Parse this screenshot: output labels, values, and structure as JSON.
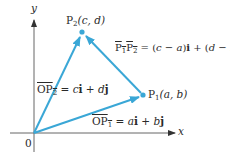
{
  "diagram": {
    "axes": {
      "x_label": "x",
      "y_label": "y",
      "origin_label": "0"
    },
    "points": {
      "p1": {
        "name": "P",
        "sub": "1",
        "coords": "(a, b)"
      },
      "p2": {
        "name": "P",
        "sub": "2",
        "coords": "(c, d)"
      }
    },
    "vectors": {
      "op1": {
        "label_name": "OP",
        "label_sub": "1",
        "expr_lhs": " = ",
        "c1": "a",
        "u1": "i",
        "plus": " + ",
        "c2": "b",
        "u2": "j"
      },
      "op2": {
        "label_name": "OP",
        "label_sub": "2",
        "expr_lhs": " = ",
        "c1": "c",
        "u1": "i",
        "plus": " + ",
        "c2": "d",
        "u2": "j"
      },
      "p1p2": {
        "label": "P1P2",
        "expr": " = (c − a)i + (d − b)j"
      }
    },
    "colors": {
      "vector": "#3aa7d6",
      "axis": "#555555",
      "text": "#2a2a2a"
    }
  }
}
